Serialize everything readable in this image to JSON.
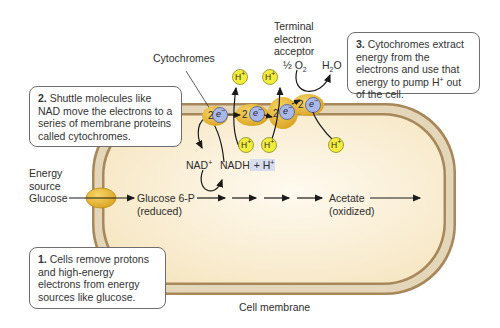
{
  "labels": {
    "cytochromes": "Cytochromes",
    "terminal_acceptor": [
      "Terminal",
      "electron",
      "acceptor"
    ],
    "half_o2_prefix": "½ O",
    "o2_sub": "2",
    "h2o_h": "H",
    "h2o_sub": "2",
    "h2o_o": "O",
    "energy_source": [
      "Energy",
      "source"
    ],
    "glucose": "Glucose",
    "glucose6p": "Glucose 6-P",
    "reduced": "(reduced)",
    "acetate": "Acetate",
    "oxidized": "(oxidized)",
    "nad_plus": "NAD",
    "nadh": "NADH",
    "h_plus_part": "+ H",
    "cell_membrane": "Cell membrane",
    "proton": "H",
    "plus": "+",
    "electron": "e",
    "minus": "−",
    "two": "2"
  },
  "steps": [
    {
      "num": "1.",
      "text": "Cells remove protons and high-energy electrons from energy sources like glucose."
    },
    {
      "num": "2.",
      "text": "Shuttle molecules like NAD move the electrons to a series of membrane proteins called cytochromes."
    },
    {
      "num": "3.",
      "text": "Cytochromes extract energy from the electrons and use that energy to pump H",
      "sup": "+",
      "tail": " out of the cell."
    }
  ],
  "colors": {
    "membrane_dark": "#a8875a",
    "membrane_light": "#e4d6b8",
    "cytoplasm": "#fbf0d8",
    "protein": "#e8b93a",
    "electron": "#a9b8e6",
    "proton": "#f2ec3c",
    "highlight": "#d7dcef"
  }
}
